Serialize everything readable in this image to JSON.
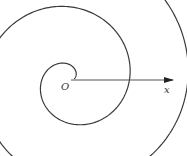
{
  "diagram": {
    "origin_label": "O",
    "axis_label": "x",
    "colors": {
      "curve": "#3a3a3a",
      "axis": "#555555",
      "background": "#ffffff"
    },
    "origin_px": [
      71,
      80
    ],
    "axis_end_px": [
      173,
      80
    ],
    "spiral": {
      "type": "archimedean",
      "r_per_radian": 10.0,
      "theta_start": 0.35,
      "theta_end": 17.5,
      "direction": "counterclockwise"
    }
  }
}
